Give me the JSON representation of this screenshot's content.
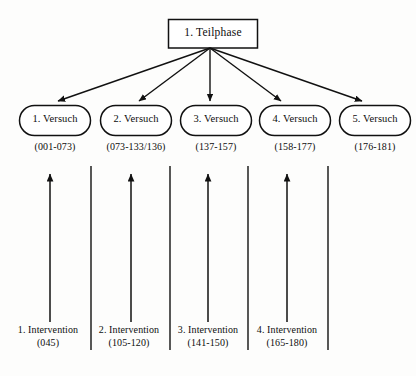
{
  "diagram": {
    "title": "1. Teilphase",
    "root": {
      "label": "1. Teilphase",
      "shape": "rectangle"
    },
    "trials": [
      {
        "label": "1. Versuch",
        "range": "(001-073)"
      },
      {
        "label": "2. Versuch",
        "range": "(073-133/136)"
      },
      {
        "label": "3. Versuch",
        "range": "(137-157)"
      },
      {
        "label": "4. Versuch",
        "range": "(158-177)"
      },
      {
        "label": "5. Versuch",
        "range": "(176-181)"
      }
    ],
    "interventions": [
      {
        "label": "1. Intervention",
        "range": "(045)"
      },
      {
        "label": "2. Intervention",
        "range": "(105-120)"
      },
      {
        "label": "3. Intervention",
        "range": "(141-150)"
      },
      {
        "label": "4. Intervention",
        "range": "(165-180)"
      }
    ],
    "colors": {
      "stroke": "#111111",
      "background": "#fdfdfc",
      "text": "#0d0d0d"
    }
  }
}
